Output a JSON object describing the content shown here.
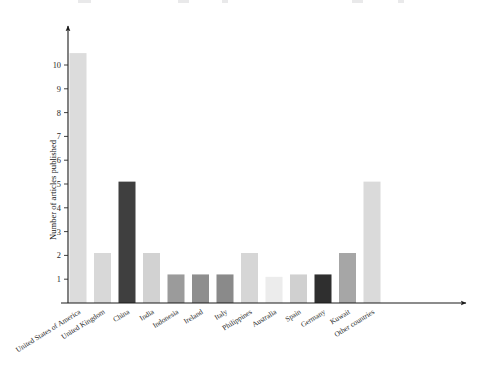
{
  "figure": {
    "width": 497,
    "height": 370,
    "background": "#ffffff"
  },
  "chart_data": {
    "type": "bar",
    "title": "",
    "subtitle": "",
    "xlabel": "",
    "ylabel": "Number of articles published",
    "ylim": [
      0,
      11.6
    ],
    "yticks": [
      1,
      2,
      3,
      4,
      5,
      6,
      7,
      8,
      9,
      10
    ],
    "ytick_labels": [
      "1",
      "2",
      "3",
      "4",
      "5",
      "6",
      "7",
      "8",
      "9",
      "10"
    ],
    "grid": false,
    "legend": null,
    "legend_position": "none",
    "axis_style": "arrow-terminated L-axes",
    "categories": [
      "United States of America",
      "United Kingdom",
      "China",
      "India",
      "Indonesia",
      "Ireland",
      "Italy",
      "Philippines",
      "Australia",
      "Spain",
      "Germany",
      "Kuwait",
      "Other countries"
    ],
    "values": [
      10.5,
      2.1,
      5.1,
      2.1,
      1.2,
      1.2,
      1.2,
      2.1,
      1.1,
      1.2,
      1.2,
      2.1,
      5.1
    ],
    "bar_colors": [
      "#dcdcdc",
      "#d8d8d8",
      "#3f3f3f",
      "#d2d2d2",
      "#9b9b9b",
      "#8e8e8e",
      "#8a8a8a",
      "#d6d6d6",
      "#ececec",
      "#d0d0d0",
      "#2f2f2f",
      "#a6a6a6",
      "#dadada"
    ]
  },
  "axes": {
    "x_axis_name": "category-axis",
    "y_axis_name": "value-axis",
    "axis_color": "#1b1b1b",
    "tick_color": "#2a2a2a",
    "label_color": "#2b2b2b",
    "x_label_rotation_deg": -32
  },
  "layout": {
    "plot_left": 68,
    "plot_right": 472,
    "baseline_y": 303,
    "y_top": 36,
    "pixels_per_unit": 23.8,
    "bar_width": 17,
    "bar_gap": 7.5
  }
}
